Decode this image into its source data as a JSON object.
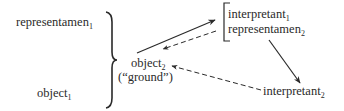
{
  "diagram": {
    "type": "semiotic-chain",
    "nodes": {
      "representamen1": {
        "text": "representamen",
        "sub": "1"
      },
      "object1": {
        "text": "object",
        "sub": "1"
      },
      "object2": {
        "text": "object",
        "sub": "2"
      },
      "ground": {
        "text": "(“ground”)"
      },
      "interpretant1": {
        "text": "interpretant",
        "sub": "1"
      },
      "representamen2": {
        "text": "representamen",
        "sub": "2"
      },
      "interpretant2": {
        "text": "interpretant",
        "sub": "2"
      }
    },
    "groupings": [
      {
        "kind": "curly-brace",
        "groups": [
          "representamen1",
          "object1"
        ]
      },
      {
        "kind": "square-bracket",
        "groups": [
          "interpretant1",
          "representamen2"
        ]
      }
    ],
    "edges": [
      {
        "from": "object2",
        "to": "interpretant1",
        "style": "solid"
      },
      {
        "from": "interpretant1",
        "to": "object2",
        "style": "dashed"
      },
      {
        "from": "representamen2",
        "to": "interpretant2",
        "style": "solid"
      },
      {
        "from": "interpretant2",
        "to": "object2",
        "style": "dashed"
      }
    ],
    "colors": {
      "ink": "#2a2a2a",
      "background": "#ffffff"
    }
  }
}
